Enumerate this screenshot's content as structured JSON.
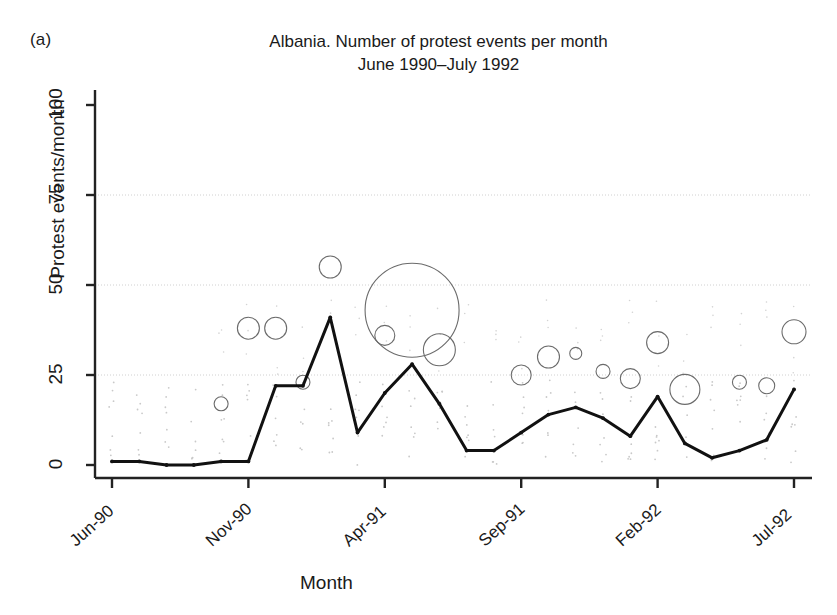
{
  "panel": {
    "label": "(a)"
  },
  "title": {
    "line1": "Albania. Number of protest events per month",
    "line2": "June 1990–July 1992"
  },
  "axes": {
    "ylabel": "Protest events/month",
    "xlabel": "Month",
    "yticks": [
      "0",
      "25",
      "50",
      "75",
      "100"
    ],
    "xticks": [
      "Jun-90",
      "Nov-90",
      "Apr-91",
      "Sep-91",
      "Feb-92",
      "Jul-92"
    ]
  },
  "chart_data": {
    "type": "line",
    "title": "Albania. Number of protest events per month June 1990–July 1992",
    "xlabel": "Month",
    "ylabel": "Protest events/month",
    "ylim": [
      0,
      100
    ],
    "grid": true,
    "grid_axis": "y",
    "grid_values": [
      25,
      50,
      75
    ],
    "legend": "none",
    "x": [
      "Jun-90",
      "Jul-90",
      "Aug-90",
      "Sep-90",
      "Oct-90",
      "Nov-90",
      "Dec-90",
      "Jan-91",
      "Feb-91",
      "Mar-91",
      "Apr-91",
      "May-91",
      "Jun-91",
      "Jul-91",
      "Aug-91",
      "Sep-91",
      "Oct-91",
      "Nov-91",
      "Dec-91",
      "Jan-92",
      "Feb-92",
      "Mar-92",
      "Apr-92",
      "May-92",
      "Jun-92",
      "Jul-92"
    ],
    "x_index": [
      0,
      1,
      2,
      3,
      4,
      5,
      6,
      7,
      8,
      9,
      10,
      11,
      12,
      13,
      14,
      15,
      16,
      17,
      18,
      19,
      20,
      21,
      22,
      23,
      24,
      25
    ],
    "xtick_index": [
      0,
      5,
      10,
      15,
      20,
      25
    ],
    "series": [
      {
        "name": "Protest events per month",
        "color": "#111111",
        "style": "solid-line-with-markers",
        "values": [
          1,
          1,
          0,
          0,
          1,
          1,
          22,
          22,
          41,
          9,
          20,
          28,
          17,
          4,
          4,
          9,
          14,
          16,
          13,
          8,
          19,
          6,
          2,
          4,
          7,
          21
        ]
      }
    ],
    "bubbles": {
      "description": "Open circles above the line; radius scales with an unlabelled magnitude variable",
      "stroke": "#6b6b6b",
      "fill": "none",
      "points": [
        {
          "x_index": 4,
          "y": 17,
          "r": 7
        },
        {
          "x_index": 5,
          "y": 38,
          "r": 11
        },
        {
          "x_index": 6,
          "y": 38,
          "r": 11
        },
        {
          "x_index": 7,
          "y": 23,
          "r": 7
        },
        {
          "x_index": 8,
          "y": 55,
          "r": 11
        },
        {
          "x_index": 10,
          "y": 36,
          "r": 10
        },
        {
          "x_index": 11,
          "y": 43,
          "r": 47
        },
        {
          "x_index": 12,
          "y": 32,
          "r": 16
        },
        {
          "x_index": 15,
          "y": 25,
          "r": 10
        },
        {
          "x_index": 16,
          "y": 30,
          "r": 11
        },
        {
          "x_index": 17,
          "y": 31,
          "r": 6
        },
        {
          "x_index": 18,
          "y": 26,
          "r": 7
        },
        {
          "x_index": 19,
          "y": 24,
          "r": 10
        },
        {
          "x_index": 20,
          "y": 34,
          "r": 11
        },
        {
          "x_index": 21,
          "y": 21,
          "r": 15
        },
        {
          "x_index": 23,
          "y": 23,
          "r": 7
        },
        {
          "x_index": 24,
          "y": 22,
          "r": 8
        },
        {
          "x_index": 25,
          "y": 37,
          "r": 12
        }
      ]
    },
    "dot_cloud": {
      "description": "Faint scattered background dots (paper scan texture / jittered minor points)",
      "color": "#bdbdbd"
    }
  }
}
